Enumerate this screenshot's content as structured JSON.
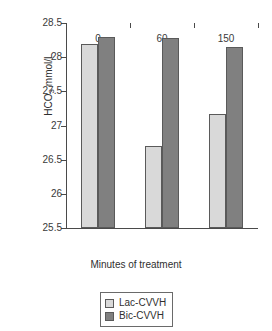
{
  "chart_data": {
    "type": "bar",
    "title": "",
    "subtitle": "",
    "xlabel": "Minutes of treatment",
    "ylabel": "HCO3 mmol/L",
    "ylabel_base": "HCO",
    "ylabel_sub": "3",
    "ylabel_unit": " mmol/L",
    "categories": [
      "0",
      "60",
      "150"
    ],
    "series": [
      {
        "name": "Lac-CVVH",
        "color": "#d9d9d9",
        "values": [
          28.2,
          26.7,
          27.17
        ]
      },
      {
        "name": "Bic-CVVH",
        "color": "#808080",
        "values": [
          28.3,
          28.28,
          28.15
        ]
      }
    ],
    "ylim": [
      25.5,
      28.5
    ],
    "ytick_labels": [
      "28.5",
      "28",
      "27.5",
      "27",
      "26.5",
      "26",
      "25.5"
    ],
    "ytick_values": [
      28.5,
      28,
      27.5,
      27,
      26.5,
      26,
      25.5
    ],
    "grid": false,
    "legend_position": "bottom-center"
  },
  "legend": {
    "entries": [
      {
        "label": "Lac-CVVH"
      },
      {
        "label": "Bic-CVVH"
      }
    ]
  }
}
